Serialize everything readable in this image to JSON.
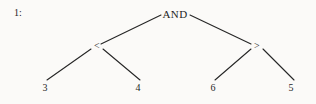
{
  "figure": {
    "index_label": "1:",
    "type": "expression-tree",
    "background_color": "#fbfaf8",
    "ink_color": "#1f1f1f"
  },
  "tree": {
    "root": {
      "id": "root",
      "label": "AND",
      "x": 175,
      "y": 14
    },
    "internal": [
      {
        "id": "left-op",
        "label": "<",
        "x": 97,
        "y": 46
      },
      {
        "id": "right-op",
        "label": ">",
        "x": 257,
        "y": 46
      }
    ],
    "leaves": [
      {
        "id": "leaf-3",
        "label": "3",
        "x": 45,
        "y": 88
      },
      {
        "id": "leaf-4",
        "label": "4",
        "x": 138,
        "y": 88
      },
      {
        "id": "leaf-6",
        "label": "6",
        "x": 213,
        "y": 88
      },
      {
        "id": "leaf-5",
        "label": "5",
        "x": 291,
        "y": 88
      }
    ],
    "edges": [
      {
        "id": "edge-root-left",
        "from": "root",
        "to": "left-op",
        "x1": 161,
        "y1": 15,
        "x2": 101,
        "y2": 44
      },
      {
        "id": "edge-root-right",
        "from": "root",
        "to": "right-op",
        "x1": 190,
        "y1": 15,
        "x2": 251,
        "y2": 44
      },
      {
        "id": "edge-left-3",
        "from": "left-op",
        "to": "leaf-3",
        "x1": 91,
        "y1": 49,
        "x2": 47,
        "y2": 80
      },
      {
        "id": "edge-left-4",
        "from": "left-op",
        "to": "leaf-4",
        "x1": 103,
        "y1": 49,
        "x2": 140,
        "y2": 80
      },
      {
        "id": "edge-right-6",
        "from": "right-op",
        "to": "leaf-6",
        "x1": 251,
        "y1": 49,
        "x2": 215,
        "y2": 80
      },
      {
        "id": "edge-right-5",
        "from": "right-op",
        "to": "leaf-5",
        "x1": 263,
        "y1": 49,
        "x2": 294,
        "y2": 80
      }
    ]
  }
}
